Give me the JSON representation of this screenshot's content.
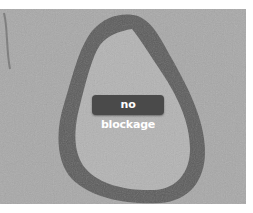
{
  "image": {
    "subject": "histology cross-section of blood vessel",
    "colors": {
      "background_tissue": "#a8a8a8",
      "vessel_wall": "#5c5c5c",
      "lumen": "#b3b3b3",
      "label_bg": "#4a4a4a",
      "label_text": "#ffffff"
    }
  },
  "annotation": {
    "label": "no blockage"
  }
}
